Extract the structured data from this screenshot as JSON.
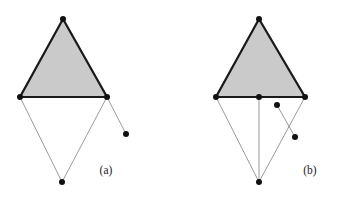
{
  "figure": {
    "background_color": "#ffffff",
    "triangle_fill_color": "#cacaca",
    "triangle_stroke_color": "#1a1a1a",
    "thin_edge_color": "#8f8f8f",
    "node_color": "#111111",
    "triangle_stroke_width": 2.2,
    "thin_edge_width": 0.9,
    "node_radius": 3.0,
    "panels": [
      {
        "id": "panel-a",
        "label": "(a)",
        "label_x": 106,
        "label_y": 174,
        "triangle": {
          "apex": {
            "x": 63,
            "y": 19
          },
          "base_left": {
            "x": 20,
            "y": 97
          },
          "base_right": {
            "x": 107,
            "y": 97
          }
        },
        "nodes": [
          {
            "name": "apex",
            "x": 63,
            "y": 19
          },
          {
            "name": "base-left",
            "x": 20,
            "y": 97
          },
          {
            "name": "base-right",
            "x": 107,
            "y": 97
          },
          {
            "name": "bottom",
            "x": 62,
            "y": 182
          },
          {
            "name": "dangling",
            "x": 126,
            "y": 134
          }
        ],
        "thin_edges": [
          {
            "name": "base-left-to-bottom",
            "x1": 20,
            "y1": 97,
            "x2": 62,
            "y2": 182
          },
          {
            "name": "base-right-to-bottom",
            "x1": 107,
            "y1": 97,
            "x2": 62,
            "y2": 182
          },
          {
            "name": "base-right-to-dangling",
            "x1": 107,
            "y1": 97,
            "x2": 126,
            "y2": 134
          }
        ]
      },
      {
        "id": "panel-b",
        "label": "(b)",
        "label_x": 310,
        "label_y": 174,
        "triangle": {
          "apex": {
            "x": 259,
            "y": 19
          },
          "base_left": {
            "x": 216,
            "y": 97
          },
          "base_right": {
            "x": 305,
            "y": 97
          }
        },
        "nodes": [
          {
            "name": "apex",
            "x": 259,
            "y": 19
          },
          {
            "name": "base-left",
            "x": 216,
            "y": 97
          },
          {
            "name": "base-middle",
            "x": 259,
            "y": 97
          },
          {
            "name": "base-right",
            "x": 305,
            "y": 97
          },
          {
            "name": "bottom",
            "x": 259,
            "y": 182
          },
          {
            "name": "free-upper",
            "x": 277,
            "y": 105
          },
          {
            "name": "free-lower",
            "x": 295,
            "y": 137
          }
        ],
        "thin_edges": [
          {
            "name": "base-left-to-bottom",
            "x1": 216,
            "y1": 97,
            "x2": 259,
            "y2": 182
          },
          {
            "name": "base-middle-to-bottom",
            "x1": 259,
            "y1": 97,
            "x2": 259,
            "y2": 182
          },
          {
            "name": "base-right-to-bottom",
            "x1": 305,
            "y1": 97,
            "x2": 259,
            "y2": 182
          },
          {
            "name": "free-upper-to-free-lower",
            "x1": 277,
            "y1": 105,
            "x2": 295,
            "y2": 137
          }
        ]
      }
    ]
  }
}
